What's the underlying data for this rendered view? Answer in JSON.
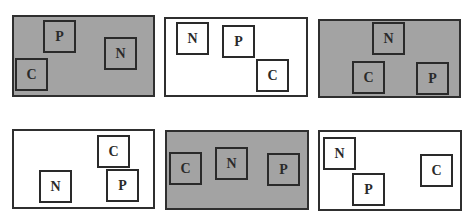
{
  "colors": {
    "gray_fill": "#a3a3a3",
    "white_fill": "#ffffff",
    "stroke": "#2a2a2a"
  },
  "panels": [
    {
      "fill": "gray",
      "boxes": [
        {
          "label": "P"
        },
        {
          "label": "N"
        },
        {
          "label": "C"
        }
      ]
    },
    {
      "fill": "white",
      "boxes": [
        {
          "label": "N"
        },
        {
          "label": "P"
        },
        {
          "label": "C"
        }
      ]
    },
    {
      "fill": "gray",
      "boxes": [
        {
          "label": "N"
        },
        {
          "label": "C"
        },
        {
          "label": "P"
        }
      ]
    },
    {
      "fill": "white",
      "boxes": [
        {
          "label": "C"
        },
        {
          "label": "N"
        },
        {
          "label": "P"
        }
      ]
    },
    {
      "fill": "gray",
      "boxes": [
        {
          "label": "C"
        },
        {
          "label": "N"
        },
        {
          "label": "P"
        }
      ]
    },
    {
      "fill": "white",
      "boxes": [
        {
          "label": "N"
        },
        {
          "label": "P"
        },
        {
          "label": "C"
        }
      ]
    }
  ]
}
